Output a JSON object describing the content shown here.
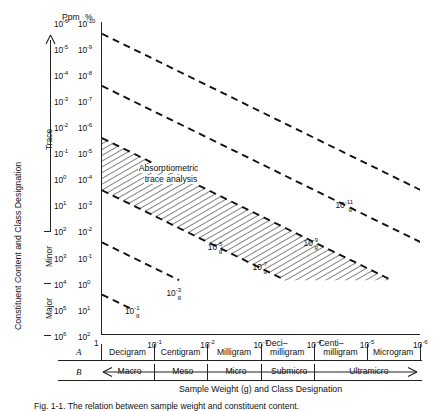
{
  "figure": {
    "caption": "Fig. 1-1. The relation between sample weight and constituent content."
  },
  "axes": {
    "y": {
      "title": "Constituent Content and Class Designation",
      "col_headers": [
        "Ppm",
        "%"
      ],
      "ppm_ticks": [
        "10-6",
        "10-5",
        "10-4",
        "10-3",
        "10-2",
        "10-1",
        "100",
        "101",
        "102",
        "103",
        "104",
        "105",
        "106"
      ],
      "pct_ticks": [
        "10-10",
        "10-9",
        "10-8",
        "10-7",
        "10-6",
        "10-5",
        "10-4",
        "10-3",
        "10-2",
        "10-1",
        "100",
        "101",
        "102"
      ],
      "ppm_mant": [
        "10",
        "10",
        "10",
        "10",
        "10",
        "10",
        "10",
        "10",
        "10",
        "10",
        "10",
        "10",
        "10"
      ],
      "ppm_exp": [
        "-6",
        "-5",
        "-4",
        "-3",
        "-2",
        "-1",
        "0",
        "1",
        "2",
        "3",
        "4",
        "5",
        "6"
      ],
      "pct_mant": [
        "10",
        "10",
        "10",
        "10",
        "10",
        "10",
        "10",
        "10",
        "10",
        "10",
        "10",
        "10",
        "10"
      ],
      "pct_exp": [
        "-10",
        "-9",
        "-8",
        "-7",
        "-6",
        "-5",
        "-4",
        "-3",
        "-2",
        "-1",
        "0",
        "1",
        "2"
      ],
      "categories": [
        {
          "label": "Trace",
          "from_tick": 1,
          "to_tick": 8
        },
        {
          "label": "Minor",
          "from_tick": 8,
          "to_tick": 10
        },
        {
          "label": "Major",
          "from_tick": 10,
          "to_tick": 12
        }
      ]
    },
    "x": {
      "title": "Sample Weight (g) and Class Designation",
      "tick_mant": [
        "1",
        "10",
        "10",
        "10",
        "10",
        "10",
        "10"
      ],
      "tick_exp": [
        "",
        "-1",
        "-2",
        "-3",
        "-4",
        "-5",
        "-6"
      ],
      "row_a_id": "A",
      "row_b_id": "B",
      "row_a_cells": [
        {
          "label": "Decigram"
        },
        {
          "label": "Centigram"
        },
        {
          "label": "Milligram"
        },
        {
          "label": "Deci–",
          "label2": "milligram"
        },
        {
          "label": "Centi–",
          "label2": "milligram"
        },
        {
          "label": "Microgram"
        }
      ],
      "row_b_cells": [
        {
          "label": "Macro",
          "span": 1
        },
        {
          "label": "Meso",
          "span": 1
        },
        {
          "label": "Micro",
          "span": 1
        },
        {
          "label": "Submicro",
          "span": 1
        },
        {
          "label": "Ultramicro",
          "span": 2
        }
      ]
    }
  },
  "chart_data": {
    "type": "line",
    "title": "",
    "xlabel": "Sample Weight (g) and Class Designation",
    "ylabel": "Constituent Content and Class Designation",
    "xlim": [
      0,
      -6
    ],
    "ylim_ppm": [
      -6,
      6
    ],
    "ylim_pct": [
      -10,
      2
    ],
    "x_log_ticks": [
      0,
      -1,
      -2,
      -3,
      -4,
      -5,
      -6
    ],
    "grid": false,
    "legend": "inline-line-labels",
    "line_style": "dashed",
    "note": "Diagonal iso-absolute-amount lines: constituent weight = sample weight x fractional content. Each line has slope -1 in log-log space.",
    "series": [
      {
        "name": "10-11 g",
        "label_mant": "10",
        "label_exp": "-11",
        "label_unit": "g",
        "x0": 0,
        "y0_pct": -9.55,
        "x1": -6,
        "y1_pct": -3.55,
        "label_x_frac": 0.735,
        "label_y_frac": 0.565
      },
      {
        "name": "10-9 g",
        "label_mant": "10",
        "label_exp": "-9",
        "label_unit": "g",
        "x0": 0,
        "y0_pct": -7.55,
        "x1": -6,
        "y1_pct": -1.55,
        "label_x_frac": 0.635,
        "label_y_frac": 0.688
      },
      {
        "name": "10-7 g",
        "label_mant": "10",
        "label_exp": "-7",
        "label_unit": "g",
        "x0": 0,
        "y0_pct": -5.55,
        "x1": -5.45,
        "y1_pct": -0.1,
        "label_x_frac": 0.475,
        "label_y_frac": 0.765
      },
      {
        "name": "10-5 g",
        "label_mant": "10",
        "label_exp": "-5",
        "label_unit": "g",
        "x0": 0,
        "y0_pct": -3.55,
        "x1": -3.45,
        "y1_pct": -0.1,
        "label_x_frac": 0.335,
        "label_y_frac": 0.7
      },
      {
        "name": "10-3 g",
        "label_mant": "10",
        "label_exp": "-3",
        "label_unit": "g",
        "x0": 0,
        "y0_pct": -1.55,
        "x1": -1.45,
        "y1_pct": -0.1,
        "label_x_frac": 0.205,
        "label_y_frac": 0.848
      },
      {
        "name": "10-1 g",
        "label_mant": "10",
        "label_exp": "-1",
        "label_unit": "g",
        "x0": 0,
        "y0_pct": 0.45,
        "x1": -0.55,
        "y1_pct": 1.0,
        "label_x_frac": 0.075,
        "label_y_frac": 0.905
      }
    ],
    "shaded_region": {
      "label_line1": "Absorptiometric",
      "label_line2": "trace analysis",
      "hatch": "diagonal",
      "bounded_by": [
        "10-5 g",
        "10-7 g"
      ],
      "label_x_frac": 0.115,
      "label_y_frac": 0.455
    }
  }
}
